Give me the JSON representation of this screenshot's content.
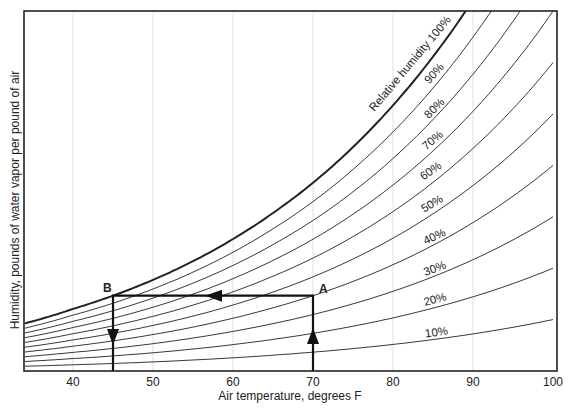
{
  "chart_data": {
    "type": "line",
    "title": "",
    "xlabel": "Air temperature, degrees F",
    "ylabel": "Humidity, pounds of water vapor per pound of air",
    "xlim": [
      34,
      100
    ],
    "xticks": [
      40,
      50,
      60,
      70,
      80,
      90,
      100
    ],
    "grid": {
      "vertical": true,
      "horizontal": false,
      "at": [
        40,
        50,
        60,
        70,
        80,
        90
      ]
    },
    "legend": "none (curves labeled inline)",
    "saturation_curve_W_lb_per_lb": {
      "T": [
        34,
        40,
        45,
        50,
        55,
        60,
        65,
        70,
        75,
        80,
        85,
        90,
        95,
        100
      ],
      "W": [
        0.004,
        0.00522,
        0.00633,
        0.00766,
        0.00923,
        0.01109,
        0.01328,
        0.01582,
        0.01882,
        0.02233,
        0.02642,
        0.03118,
        0.03673,
        0.0432
      ]
    },
    "series": [
      {
        "name": "Relative humidity 100%",
        "rh": 100,
        "label": "Relative humidity 100%",
        "bold": true
      },
      {
        "name": "90%",
        "rh": 90,
        "label": "90%"
      },
      {
        "name": "80%",
        "rh": 80,
        "label": "80%"
      },
      {
        "name": "70%",
        "rh": 70,
        "label": "70%"
      },
      {
        "name": "60%",
        "rh": 60,
        "label": "60%"
      },
      {
        "name": "50%",
        "rh": 50,
        "label": "50%"
      },
      {
        "name": "40%",
        "rh": 40,
        "label": "40%"
      },
      {
        "name": "30%",
        "rh": 30,
        "label": "30%"
      },
      {
        "name": "20%",
        "rh": 20,
        "label": "20%"
      },
      {
        "name": "10%",
        "rh": 10,
        "label": "10%"
      }
    ],
    "annotations": [
      {
        "label": "A",
        "T": 70,
        "description": "Air at 70°F, ~40% RH"
      },
      {
        "label": "B",
        "T": 45,
        "description": "Dew point ~45°F (saturation)"
      },
      {
        "path": "From 70°F (bottom) up to A, left horizontally to B at 100% RH, then down at 45°F",
        "arrows": [
          "up at 70°F",
          "left along constant humidity",
          "down at 45°F"
        ]
      }
    ]
  },
  "labels": {
    "x_axis": "Air temperature, degrees F",
    "y_axis": "Humidity, pounds of water vapor per pound of air",
    "point_a": "A",
    "point_b": "B"
  },
  "layout": {
    "plot": {
      "left": 24,
      "right": 557,
      "top": 11,
      "bottom": 371
    },
    "x_origin_T": 40,
    "x_origin_px": 73,
    "px_per_degree": 8,
    "px_per_W": 11900,
    "rh_label_positions": [
      {
        "rh": 100,
        "x": 413,
        "y": 66,
        "angle": -50
      },
      {
        "rh": 90,
        "x": 437,
        "y": 76,
        "angle": -48
      },
      {
        "rh": 80,
        "x": 437,
        "y": 111,
        "angle": -45
      },
      {
        "rh": 70,
        "x": 435,
        "y": 143,
        "angle": -40
      },
      {
        "rh": 60,
        "x": 433,
        "y": 174,
        "angle": -35
      },
      {
        "rh": 50,
        "x": 434,
        "y": 207,
        "angle": -30
      },
      {
        "rh": 40,
        "x": 436,
        "y": 240,
        "angle": -25
      },
      {
        "rh": 30,
        "x": 436,
        "y": 272,
        "angle": -20
      },
      {
        "rh": 20,
        "x": 436,
        "y": 303,
        "angle": -15
      },
      {
        "rh": 10,
        "x": 437,
        "y": 336,
        "angle": -8
      }
    ]
  }
}
